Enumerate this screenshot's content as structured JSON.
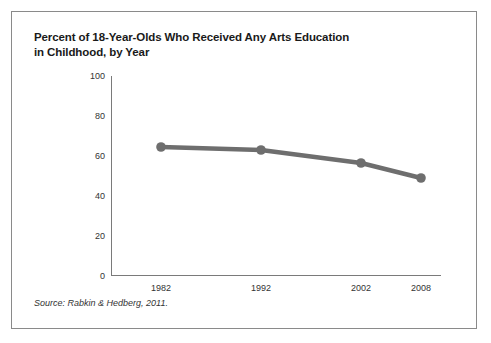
{
  "figure": {
    "title_line1": "Percent of 18-Year-Olds Who Received Any Arts Education",
    "title_line2": "in Childhood, by Year",
    "source": "Source: Rabkin & Hedberg, 2011."
  },
  "chart_data": {
    "type": "line",
    "title": "Percent of 18-Year-Olds Who Received Any Arts Education in Childhood, by Year",
    "categories": [
      "1982",
      "1992",
      "2002",
      "2008"
    ],
    "values": [
      64.5,
      63,
      56.5,
      49
    ],
    "xlabel": "",
    "ylabel": "",
    "ylim": [
      0,
      100
    ],
    "yticks": [
      0,
      20,
      40,
      60,
      80,
      100
    ],
    "ytick_labels": [
      "0",
      "20",
      "40",
      "60",
      "80",
      "100"
    ],
    "grid": false,
    "legend": "none",
    "line_color": "#6e6e6e",
    "marker_color": "#6e6e6e",
    "axis_color": "#7a7a7a"
  }
}
